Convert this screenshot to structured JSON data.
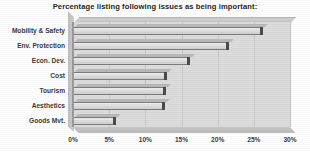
{
  "chart_data": {
    "type": "bar",
    "orientation": "horizontal",
    "title": "Percentage listing following issues as being important:",
    "xlabel": "",
    "ylabel": "",
    "categories": [
      "Mobility & Safety",
      "Env. Protection",
      "Econ. Dev.",
      "Cost",
      "Tourism",
      "Aesthetics",
      "Goods Mvt."
    ],
    "values": [
      26.3,
      21.5,
      16.2,
      13.0,
      12.9,
      12.7,
      6.0
    ],
    "xlim": [
      0,
      30
    ],
    "xticks": [
      0,
      5,
      10,
      15,
      20,
      25,
      30
    ],
    "xtick_labels": [
      "0%",
      "5%",
      "10%",
      "15%",
      "20%",
      "25%",
      "30%"
    ],
    "grid": true,
    "legend": false,
    "style_3d": true,
    "colors": {
      "plot_background": "#dcdcdc",
      "bar_fill": "#e2e2e2",
      "bar_outline": "#7d7d7d",
      "bar_cap": "#4a4a4a",
      "gridline": "#c9c9c9",
      "text": "#3a3a3a",
      "title": "#262626",
      "page_background": "#ffffff"
    }
  }
}
